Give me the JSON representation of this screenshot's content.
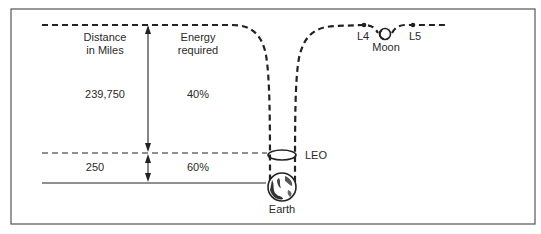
{
  "diagram": {
    "columns": {
      "distance_header": [
        "Distance",
        "in Miles"
      ],
      "energy_header": [
        "Energy",
        "required"
      ]
    },
    "rows": [
      {
        "distance": "239,750",
        "energy": "40%"
      },
      {
        "distance": "250",
        "energy": "60%"
      }
    ],
    "labels": {
      "leo": "LEO",
      "earth": "Earth",
      "moon": "Moon",
      "l4": "L4",
      "l5": "L5"
    },
    "colors": {
      "ink": "#222222",
      "frame": "#555555",
      "background": "#ffffff"
    }
  }
}
